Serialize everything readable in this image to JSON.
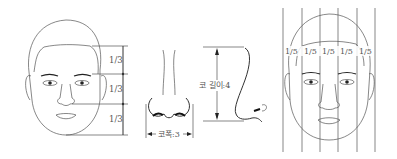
{
  "figure": {
    "panels": [
      {
        "id": "face-thirds",
        "labels": [
          "1/3",
          "1/3",
          "1/3"
        ]
      },
      {
        "id": "nose-front",
        "width_label": "코폭:3"
      },
      {
        "id": "nose-side",
        "length_label": "코 길이:4"
      },
      {
        "id": "face-fifths",
        "labels": [
          "1/5",
          "1/5",
          "1/5",
          "1/5",
          "1/5"
        ]
      }
    ],
    "colors": {
      "line": "#555555",
      "feature": "#222222",
      "background": "#ffffff"
    }
  }
}
